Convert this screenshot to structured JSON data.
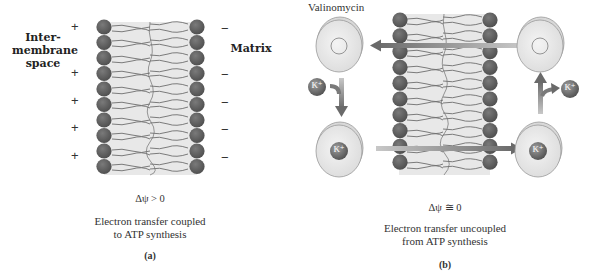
{
  "panel_a": {
    "label": "(a)",
    "side_left_label": "Inter-\nmembrane\nspace",
    "side_left_lines": [
      "Inter-",
      "membrane",
      "space"
    ],
    "side_right_label": "Matrix",
    "left_signs": [
      "+",
      "+",
      "+",
      "+",
      "+"
    ],
    "right_signs": [
      "−",
      "−",
      "−",
      "−",
      "−"
    ],
    "potential": "Δψ > 0",
    "caption_lines": [
      "Electron transfer coupled",
      "to ATP synthesis"
    ]
  },
  "panel_b": {
    "label": "(b)",
    "carrier_label": "Valinomycin",
    "ion_label": "K⁺",
    "ion_label_text": "K",
    "ion_charge": "+",
    "potential": "Δψ ≅ 0",
    "caption_lines": [
      "Electron transfer uncoupled",
      "from ATP synthesis"
    ]
  },
  "colors": {
    "lipid_head": "#5e5e5e",
    "lipid_tail_fill": "#e6e6e6",
    "lipid_tail_stroke": "#6a6a6a",
    "arrow": "#707070",
    "carrier_fill": "#ececec",
    "carrier_stroke": "#9a9a9a",
    "ion": "#666666"
  }
}
